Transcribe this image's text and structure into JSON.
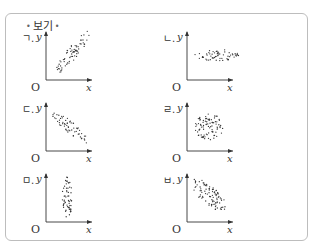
{
  "box": {
    "title": "보기"
  },
  "axes": {
    "x_label": "x",
    "y_label": "y",
    "origin_label": "O"
  },
  "panels": [
    {
      "label": "ㄱ.",
      "pattern": "strong-positive",
      "cx": 27,
      "cy": -28,
      "rx": 26,
      "ry": 6,
      "angle": -52,
      "density": 70
    },
    {
      "label": "ㄴ.",
      "pattern": "no-correlation-horizontal",
      "cx": 30,
      "cy": -25,
      "rx": 22,
      "ry": 6,
      "angle": 0,
      "density": 60
    },
    {
      "label": "ㄷ.",
      "pattern": "strong-negative",
      "cx": 24,
      "cy": -24,
      "rx": 24,
      "ry": 5.5,
      "angle": 40,
      "density": 60
    },
    {
      "label": "ㄹ.",
      "pattern": "no-correlation-circular",
      "cx": 22,
      "cy": -24,
      "rx": 14,
      "ry": 14,
      "angle": 0,
      "density": 90
    },
    {
      "label": "ㅁ.",
      "pattern": "no-correlation-vertical",
      "cx": 21,
      "cy": -24,
      "rx": 5,
      "ry": 21,
      "angle": 0,
      "density": 60
    },
    {
      "label": "ㅂ.",
      "pattern": "weak-negative",
      "cx": 22,
      "cy": -27,
      "rx": 22,
      "ry": 9,
      "angle": 42,
      "density": 90
    }
  ],
  "chart_data": {
    "type": "scatter",
    "title": "보기",
    "xlabel": "x",
    "ylabel": "y",
    "grid": false,
    "panels": [
      {
        "label": "ㄱ",
        "correlation": "strong positive",
        "shape": "narrow ellipse rising left-to-right"
      },
      {
        "label": "ㄴ",
        "correlation": "none",
        "shape": "horizontal band (y roughly constant)"
      },
      {
        "label": "ㄷ",
        "correlation": "strong negative",
        "shape": "narrow ellipse falling left-to-right"
      },
      {
        "label": "ㄹ",
        "correlation": "none",
        "shape": "circular cloud"
      },
      {
        "label": "ㅁ",
        "correlation": "none",
        "shape": "vertical band (x roughly constant)"
      },
      {
        "label": "ㅂ",
        "correlation": "weak negative",
        "shape": "wide ellipse falling left-to-right"
      }
    ]
  }
}
